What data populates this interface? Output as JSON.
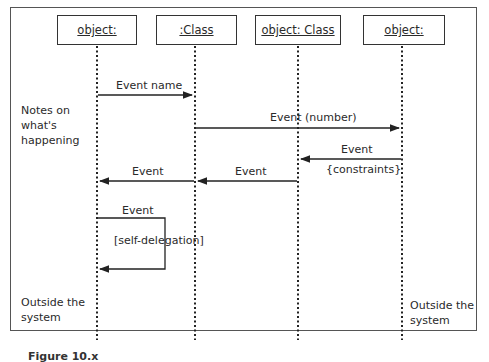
{
  "objects": [
    {
      "label": "object:"
    },
    {
      "label": ":Class"
    },
    {
      "label": "object: Class"
    },
    {
      "label": "object:"
    }
  ],
  "messages": [
    {
      "label": "Event name",
      "from": 0,
      "to": 1
    },
    {
      "label": "Event (number)",
      "from": 1,
      "to": 3
    },
    {
      "label": "Event",
      "guard": "{constraints}",
      "from": 3,
      "to": 2
    },
    {
      "label": "Event",
      "from": 2,
      "to": 1
    },
    {
      "label": "Event",
      "from": 1,
      "to": 0
    },
    {
      "label": "Event",
      "guard": "[self-delegation]",
      "from": 0,
      "to": 0
    }
  ],
  "notes": {
    "left_top": [
      "Notes on",
      "what's",
      "happening"
    ],
    "left_bottom": [
      "Outside the",
      "system"
    ],
    "right_bottom": [
      "Outside the",
      "system"
    ]
  },
  "caption": "Figure 10.x"
}
